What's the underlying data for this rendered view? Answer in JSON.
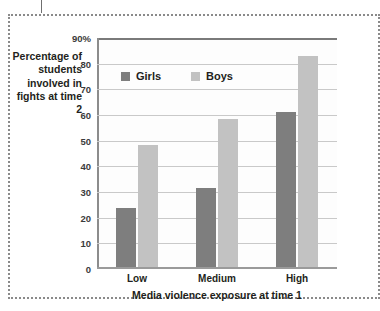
{
  "chart_data": {
    "type": "bar",
    "title": "",
    "categories": [
      "Low",
      "Medium",
      "High"
    ],
    "series": [
      {
        "name": "Girls",
        "values": [
          23,
          31,
          61
        ],
        "color": "#7e7e7e"
      },
      {
        "name": "Boys",
        "values": [
          48,
          58,
          83
        ],
        "color": "#c2c2c2"
      }
    ],
    "xlabel": "Media violence exposure at time 1",
    "ylabel": "Percentage of students involved in fights at time 2",
    "ylim": [
      0,
      90
    ],
    "ytick_labels": [
      "0",
      "10",
      "20",
      "30",
      "40",
      "50",
      "60",
      "70",
      "80",
      "90%"
    ],
    "ytick_values": [
      0,
      10,
      20,
      30,
      40,
      50,
      60,
      70,
      80,
      90
    ],
    "grid": true,
    "legend_position": "top-left-inside"
  },
  "axes": {
    "y_title": "Percentage of students involved in fights at time 2",
    "x_title": "Media violence exposure at time 1"
  },
  "legend": {
    "items": [
      {
        "label": "Girls",
        "color": "#7e7e7e"
      },
      {
        "label": "Boys",
        "color": "#c2c2c2"
      }
    ]
  }
}
